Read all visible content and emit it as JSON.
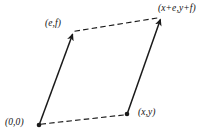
{
  "figure": {
    "type": "vector-addition-parallelogram",
    "background_color": "#ffffff",
    "ink_color": "#1a1a1a",
    "labels": {
      "origin": "(0,0)",
      "vector_ef": "(e,f)",
      "vector_xy": "(x,y)",
      "vector_sum": "(x+e,y+f)"
    },
    "geometry": {
      "origin_point": {
        "x": 39,
        "y": 125
      },
      "ef_point": {
        "x": 73,
        "y": 32
      },
      "xy_point": {
        "x": 127,
        "y": 114
      },
      "sum_point": {
        "x": 161,
        "y": 17
      }
    },
    "edges": [
      {
        "name": "solid-vector-origin-to-ef",
        "style": "solid",
        "arrowhead": "end"
      },
      {
        "name": "solid-vector-xy-to-sum",
        "style": "solid",
        "arrowhead": "end"
      },
      {
        "name": "dashed-edge-origin-to-xy",
        "style": "dashed",
        "arrowhead": "none"
      },
      {
        "name": "dashed-edge-ef-to-sum",
        "style": "dashed",
        "arrowhead": "none"
      }
    ],
    "dots": [
      {
        "name": "origin-dot"
      },
      {
        "name": "xy-dot"
      }
    ]
  }
}
